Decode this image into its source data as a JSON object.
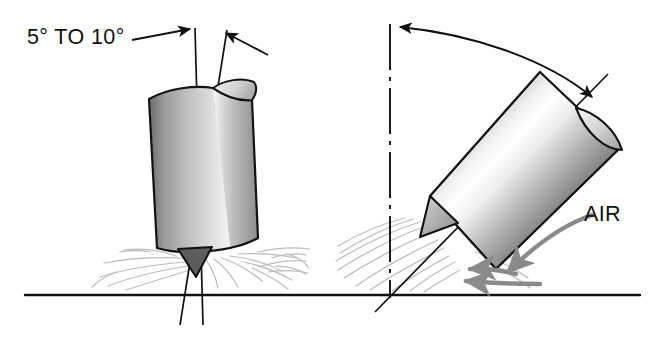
{
  "figure": {
    "background_color": "#ffffff",
    "line_color": "#121212",
    "spray_color": "#b9b9b9",
    "arrow_gray": "#8a8a8a",
    "ground_line_color": "#121212"
  },
  "labels": {
    "angle_label": "5° TO 10°",
    "air_label": "AIR"
  },
  "left_view": {
    "name": "near-vertical nozzle view",
    "description": "Cylindrical nozzle tilted slightly from vertical resting above ground line",
    "tilt_degrees_min": 5,
    "tilt_degrees_max": 10,
    "reference_line_type": "vertical-dashed",
    "axis_line_type": "solid-tilted",
    "leader_arrow_count": 2,
    "nozzle_tip": "small dark triangle",
    "spray_pattern": "radial wisps on ground"
  },
  "right_view": {
    "name": "angled nozzle view",
    "description": "Cylindrical nozzle held at approximately 45 degrees with air stream arrows",
    "approx_tilt_degrees": 45,
    "reference_line_type": "vertical-dash-dot",
    "arc_arrow": "double-headed curved arc from vertical to nozzle axis",
    "air_arrow_count": 2,
    "air_arrow_direction": "left along ground",
    "nozzle_tip": "small gray triangle",
    "spray_pattern": "diagonal wisps along ground"
  },
  "cylinder_shading": {
    "edge_dark": "#6e6e6e",
    "mid_dark": "#8e8e8e",
    "highlight": "#ffffff",
    "body_light": "#d8d8d8",
    "body_mid": "#a8a8a8",
    "outline": "#121212"
  },
  "ground": {
    "y": 295,
    "x_start": 25,
    "x_end": 640
  }
}
